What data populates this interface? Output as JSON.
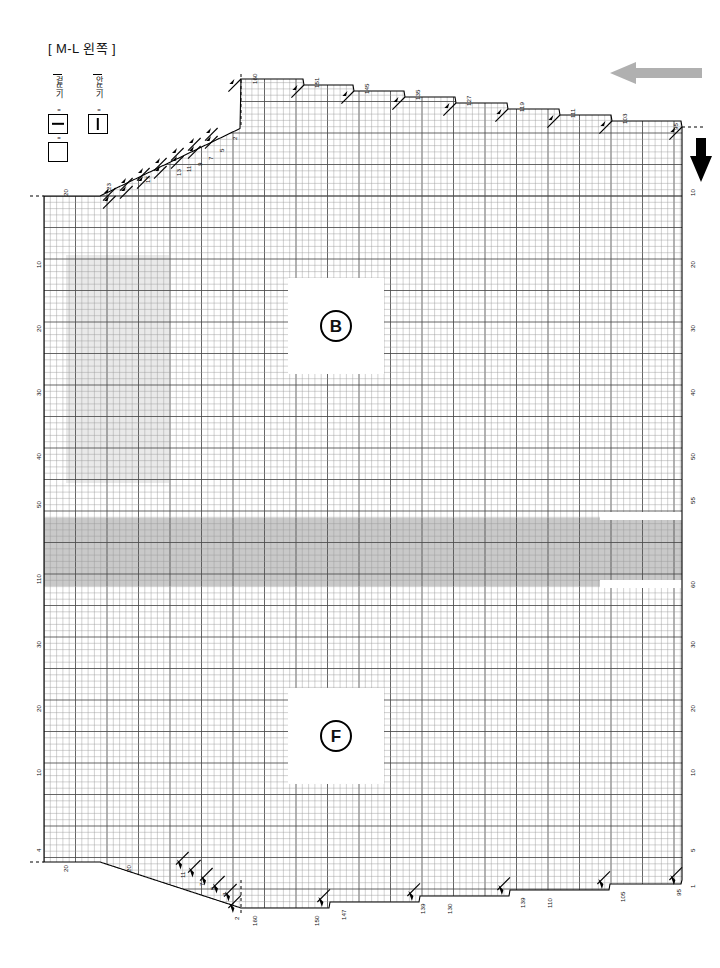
{
  "title": "[ M-L 왼쪽 ]",
  "legend": {
    "items": [
      {
        "name": "knit",
        "label": "겉뜨기",
        "eq": "=",
        "symbol": "dash"
      },
      {
        "name": "purl",
        "label": "안뜨기",
        "eq": "=",
        "symbol": "bar"
      },
      {
        "name": "blank",
        "label": "",
        "eq": "=",
        "symbol": "plain"
      }
    ]
  },
  "arrows": [
    {
      "name": "direction-arrow-left",
      "direction": "left",
      "color": "#b0b0b0"
    },
    {
      "name": "direction-arrow-down",
      "direction": "down",
      "color": "#000000"
    }
  ],
  "badges": [
    {
      "name": "back-panel-badge",
      "letter": "B"
    },
    {
      "name": "front-panel-badge",
      "letter": "F"
    }
  ],
  "colors": {
    "grid_minor": "#9a9a9a",
    "grid_major": "#4a4a4a",
    "outline": "#000000",
    "shade_light": "#e9e9e9",
    "shade_band": "#c9c9c9",
    "arrow_gray": "#b0b0b0"
  },
  "chart_data": {
    "type": "table",
    "xlabel": "",
    "ylabel": "",
    "cell_px": 6.3,
    "major_every": 5,
    "grid": true,
    "legend_position": "top-left",
    "top_labels": [
      {
        "text": "160",
        "x": 252,
        "y": 84
      },
      {
        "text": "151",
        "x": 314,
        "y": 88
      },
      {
        "text": "145",
        "x": 364,
        "y": 94
      },
      {
        "text": "135",
        "x": 415,
        "y": 100
      },
      {
        "text": "127",
        "x": 466,
        "y": 106
      },
      {
        "text": "119",
        "x": 519,
        "y": 112
      },
      {
        "text": "111",
        "x": 570,
        "y": 118
      },
      {
        "text": "103",
        "x": 622,
        "y": 124
      },
      {
        "text": "95",
        "x": 673,
        "y": 130
      }
    ],
    "top_left_labels": [
      {
        "text": "20",
        "x": 63,
        "y": 196
      },
      {
        "text": "23",
        "x": 106,
        "y": 190
      },
      {
        "text": "17",
        "x": 145,
        "y": 183
      },
      {
        "text": "13",
        "x": 176,
        "y": 176
      },
      {
        "text": "11",
        "x": 186,
        "y": 172
      },
      {
        "text": "9",
        "x": 197,
        "y": 166
      },
      {
        "text": "7",
        "x": 208,
        "y": 160
      },
      {
        "text": "5",
        "x": 219,
        "y": 152
      },
      {
        "text": "2",
        "x": 232,
        "y": 140
      }
    ],
    "left_labels": [
      {
        "text": "10",
        "y": 268
      },
      {
        "text": "20",
        "y": 332
      },
      {
        "text": "30",
        "y": 396
      },
      {
        "text": "40",
        "y": 460
      },
      {
        "text": "50",
        "y": 508
      },
      {
        "text": "110",
        "y": 584
      },
      {
        "text": "30",
        "y": 648
      },
      {
        "text": "20",
        "y": 712
      },
      {
        "text": "10",
        "y": 776
      },
      {
        "text": "4",
        "y": 852
      }
    ],
    "right_labels": [
      {
        "text": "10",
        "y": 196
      },
      {
        "text": "20",
        "y": 268
      },
      {
        "text": "30",
        "y": 332
      },
      {
        "text": "40",
        "y": 396
      },
      {
        "text": "50",
        "y": 460
      },
      {
        "text": "55",
        "y": 504
      },
      {
        "text": "60",
        "y": 588
      },
      {
        "text": "30",
        "y": 648
      },
      {
        "text": "20",
        "y": 712
      },
      {
        "text": "10",
        "y": 776
      },
      {
        "text": "5",
        "y": 852
      },
      {
        "text": "1",
        "y": 888
      }
    ],
    "bottom_left_labels": [
      {
        "text": "20",
        "x": 63,
        "y": 872
      },
      {
        "text": "20",
        "x": 126,
        "y": 872
      },
      {
        "text": "11",
        "x": 180,
        "y": 878
      },
      {
        "text": "7",
        "x": 199,
        "y": 886
      },
      {
        "text": "5",
        "x": 210,
        "y": 890
      },
      {
        "text": "3",
        "x": 222,
        "y": 896
      },
      {
        "text": "2",
        "x": 234,
        "y": 920
      }
    ],
    "bottom_labels": [
      {
        "text": "160",
        "x": 252,
        "y": 926
      },
      {
        "text": "150",
        "x": 314,
        "y": 926
      },
      {
        "text": "147",
        "x": 341,
        "y": 920
      },
      {
        "text": "139",
        "x": 420,
        "y": 914
      },
      {
        "text": "130",
        "x": 447,
        "y": 914
      },
      {
        "text": "139",
        "x": 520,
        "y": 908
      },
      {
        "text": "110",
        "x": 547,
        "y": 908
      },
      {
        "text": "105",
        "x": 620,
        "y": 902
      },
      {
        "text": "95",
        "x": 676,
        "y": 896
      }
    ],
    "shaded_regions": [
      {
        "name": "left-shade",
        "x": 66,
        "y": 255,
        "w": 103,
        "h": 228,
        "color": "#e9e9e9"
      },
      {
        "name": "center-band",
        "x": 44,
        "y": 518,
        "w": 638,
        "h": 68,
        "color": "#c9c9c9"
      }
    ],
    "badge_panels": [
      {
        "letter": "B",
        "x": 288,
        "y": 278,
        "w": 96,
        "h": 96
      },
      {
        "letter": "F",
        "x": 288,
        "y": 688,
        "w": 96,
        "h": 96
      }
    ],
    "top_steps": [
      {
        "x": 241,
        "y": 79
      },
      {
        "x": 304,
        "y": 85
      },
      {
        "x": 354,
        "y": 91
      },
      {
        "x": 405,
        "y": 97
      },
      {
        "x": 456,
        "y": 103
      },
      {
        "x": 508,
        "y": 109
      },
      {
        "x": 560,
        "y": 115
      },
      {
        "x": 612,
        "y": 121
      },
      {
        "x": 682,
        "y": 127
      }
    ],
    "bottom_steps": [
      {
        "x": 241,
        "y": 908
      },
      {
        "x": 330,
        "y": 902
      },
      {
        "x": 420,
        "y": 896
      },
      {
        "x": 510,
        "y": 890
      },
      {
        "x": 610,
        "y": 884
      },
      {
        "x": 682,
        "y": 880
      }
    ]
  }
}
